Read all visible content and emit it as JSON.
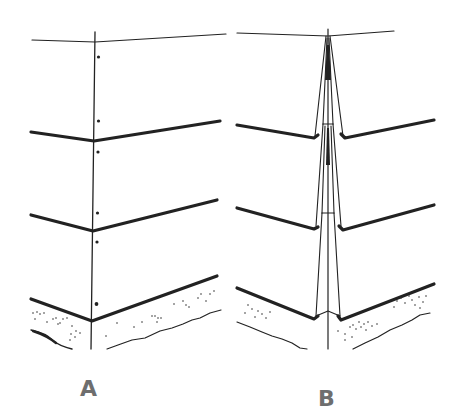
{
  "figure": {
    "colors": {
      "line": "#222222",
      "label": "#6e6e6e",
      "background": "#ffffff"
    }
  },
  "panels": [
    {
      "id": "A",
      "label": "A",
      "description": "Siding courses meeting at a single vertical corner line with nail dots"
    },
    {
      "id": "B",
      "label": "B",
      "description": "Siding courses meeting a tapered corner board assembly with lapped joints"
    }
  ]
}
